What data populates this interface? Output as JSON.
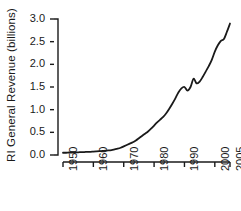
{
  "chart_data": {
    "type": "line",
    "title": "",
    "xlabel": "",
    "ylabel": "RI General Revenue (billions)",
    "xlim": [
      1950,
      2005
    ],
    "ylim": [
      0.0,
      3.0
    ],
    "grid": false,
    "legend": null,
    "xticks": [
      1950,
      1960,
      1970,
      1980,
      1990,
      2000,
      2005
    ],
    "xtick_labels": [
      "1950",
      "1960",
      "1970",
      "1980",
      "1990",
      "2000",
      "2005"
    ],
    "yticks": [
      0.0,
      0.5,
      1.0,
      1.5,
      2.0,
      2.5,
      3.0
    ],
    "ytick_labels": [
      "0.0",
      "0.5",
      "1.0",
      "1.5",
      "2.0",
      "2.5",
      "3.0"
    ],
    "line_color": "#1a1a1a",
    "line_width": 1.8,
    "x": [
      1950,
      1951,
      1952,
      1953,
      1954,
      1955,
      1956,
      1957,
      1958,
      1959,
      1960,
      1961,
      1962,
      1963,
      1964,
      1965,
      1966,
      1967,
      1968,
      1969,
      1970,
      1971,
      1972,
      1973,
      1974,
      1975,
      1976,
      1977,
      1978,
      1979,
      1980,
      1981,
      1982,
      1983,
      1984,
      1985,
      1986,
      1987,
      1988,
      1989,
      1990,
      1991,
      1992,
      1993,
      1994,
      1995,
      1996,
      1997,
      1998,
      1999,
      2000,
      2001,
      2002,
      2003,
      2004,
      2005
    ],
    "values": [
      0.05,
      0.05,
      0.055,
      0.055,
      0.06,
      0.06,
      0.065,
      0.065,
      0.07,
      0.07,
      0.075,
      0.08,
      0.085,
      0.09,
      0.095,
      0.1,
      0.11,
      0.125,
      0.14,
      0.16,
      0.19,
      0.22,
      0.25,
      0.28,
      0.32,
      0.37,
      0.42,
      0.47,
      0.52,
      0.58,
      0.65,
      0.72,
      0.78,
      0.84,
      0.92,
      1.02,
      1.13,
      1.25,
      1.38,
      1.47,
      1.5,
      1.42,
      1.5,
      1.68,
      1.58,
      1.62,
      1.72,
      1.84,
      1.96,
      2.1,
      2.28,
      2.42,
      2.52,
      2.56,
      2.72,
      2.9
    ],
    "series": [
      {
        "name": "RI General Revenue",
        "values": [
          0.05,
          0.05,
          0.055,
          0.055,
          0.06,
          0.06,
          0.065,
          0.065,
          0.07,
          0.07,
          0.075,
          0.08,
          0.085,
          0.09,
          0.095,
          0.1,
          0.11,
          0.125,
          0.14,
          0.16,
          0.19,
          0.22,
          0.25,
          0.28,
          0.32,
          0.37,
          0.42,
          0.47,
          0.52,
          0.58,
          0.65,
          0.72,
          0.78,
          0.84,
          0.92,
          1.02,
          1.13,
          1.25,
          1.38,
          1.47,
          1.5,
          1.42,
          1.5,
          1.68,
          1.58,
          1.62,
          1.72,
          1.84,
          1.96,
          2.1,
          2.28,
          2.42,
          2.52,
          2.56,
          2.72,
          2.9
        ]
      }
    ]
  },
  "axes": {
    "plot_left": 63,
    "plot_right": 230,
    "plot_top": 19,
    "plot_bottom": 155,
    "spine_color": "#1a1a1a"
  }
}
